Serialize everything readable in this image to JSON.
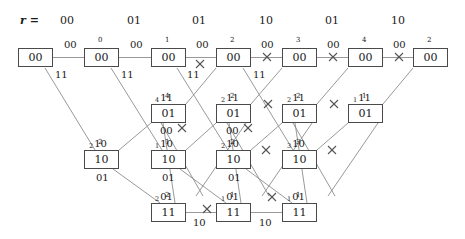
{
  "header": {
    "prefix": "r =",
    "values": [
      "00",
      "01",
      "01",
      "10",
      "01",
      "10"
    ]
  },
  "colors": {
    "box_border": "#4a4a4a",
    "edge": "#8a8a8a",
    "text": "#1a1a1a",
    "background": "#ffffff"
  },
  "chart_data": {
    "type": "diagram",
    "states": [
      "00",
      "01",
      "10",
      "11"
    ],
    "stages": 7,
    "nodes": [
      {
        "id": "s0_0",
        "state": "00",
        "col": 0,
        "x": 18,
        "y": 48,
        "label": "00",
        "metric": ""
      },
      {
        "id": "s1_0",
        "state": "00",
        "col": 1,
        "x": 84,
        "y": 48,
        "label": "00",
        "metric": "0"
      },
      {
        "id": "s2_0",
        "state": "00",
        "col": 2,
        "x": 151,
        "y": 48,
        "label": "00",
        "metric": "1"
      },
      {
        "id": "s3_0",
        "state": "00",
        "col": 3,
        "x": 216,
        "y": 48,
        "label": "00",
        "metric": "2"
      },
      {
        "id": "s4_0",
        "state": "00",
        "col": 4,
        "x": 282,
        "y": 48,
        "label": "00",
        "metric": "3"
      },
      {
        "id": "s5_0",
        "state": "00",
        "col": 5,
        "x": 348,
        "y": 48,
        "label": "00",
        "metric": "4"
      },
      {
        "id": "s6_0",
        "state": "00",
        "col": 6,
        "x": 413,
        "y": 48,
        "label": "00",
        "metric": "2"
      },
      {
        "id": "s2_1",
        "state": "01",
        "col": 2,
        "x": 151,
        "y": 104,
        "label": "01",
        "metric": "4"
      },
      {
        "id": "s3_1",
        "state": "01",
        "col": 3,
        "x": 216,
        "y": 104,
        "label": "01",
        "metric": "2"
      },
      {
        "id": "s4_1",
        "state": "01",
        "col": 4,
        "x": 282,
        "y": 104,
        "label": "01",
        "metric": "2"
      },
      {
        "id": "s5_1",
        "state": "01",
        "col": 5,
        "x": 348,
        "y": 104,
        "label": "01",
        "metric": "1"
      },
      {
        "id": "s1_2",
        "state": "10",
        "col": 1,
        "x": 84,
        "y": 150,
        "label": "10",
        "metric": "2"
      },
      {
        "id": "s2_2",
        "state": "10",
        "col": 2,
        "x": 151,
        "y": 150,
        "label": "10",
        "metric": "1"
      },
      {
        "id": "s3_2",
        "state": "10",
        "col": 3,
        "x": 216,
        "y": 150,
        "label": "10",
        "metric": "2"
      },
      {
        "id": "s4_2",
        "state": "10",
        "col": 4,
        "x": 282,
        "y": 150,
        "label": "10",
        "metric": "3"
      },
      {
        "id": "s2_3",
        "state": "11",
        "col": 2,
        "x": 151,
        "y": 203,
        "label": "11",
        "metric": "2"
      },
      {
        "id": "s3_3",
        "state": "11",
        "col": 3,
        "x": 216,
        "y": 203,
        "label": "11",
        "metric": "1"
      },
      {
        "id": "s4_3",
        "state": "11",
        "col": 4,
        "x": 282,
        "y": 203,
        "label": "11",
        "metric": "1"
      }
    ],
    "edge_labels": [
      {
        "text": "00",
        "x": 64,
        "y": 40,
        "sub": ""
      },
      {
        "text": "00",
        "x": 130,
        "y": 40,
        "sub": ""
      },
      {
        "text": "00",
        "x": 196,
        "y": 40,
        "sub": ""
      },
      {
        "text": "00",
        "x": 261,
        "y": 40,
        "sub": ""
      },
      {
        "text": "00",
        "x": 327,
        "y": 40,
        "sub": ""
      },
      {
        "text": "00",
        "x": 393,
        "y": 40,
        "sub": ""
      },
      {
        "text": "11",
        "x": 55,
        "y": 70,
        "sub": ""
      },
      {
        "text": "11",
        "x": 121,
        "y": 70,
        "sub": ""
      },
      {
        "text": "11",
        "x": 187,
        "y": 70,
        "sub": ""
      },
      {
        "text": "11",
        "x": 253,
        "y": 70,
        "sub": ""
      },
      {
        "text": "11",
        "x": 155,
        "y": 93,
        "sub": "4"
      },
      {
        "text": "11",
        "x": 221,
        "y": 93,
        "sub": "2"
      },
      {
        "text": "11",
        "x": 287,
        "y": 93,
        "sub": "2"
      },
      {
        "text": "11",
        "x": 353,
        "y": 93,
        "sub": "1"
      },
      {
        "text": "00",
        "x": 160,
        "y": 126,
        "sub": ""
      },
      {
        "text": "00",
        "x": 226,
        "y": 126,
        "sub": ""
      },
      {
        "text": "10",
        "x": 89,
        "y": 139,
        "sub": "2"
      },
      {
        "text": "10",
        "x": 155,
        "y": 139,
        "sub": "1"
      },
      {
        "text": "10",
        "x": 221,
        "y": 139,
        "sub": "2"
      },
      {
        "text": "10",
        "x": 287,
        "y": 139,
        "sub": "3"
      },
      {
        "text": "01",
        "x": 96,
        "y": 173,
        "sub": ""
      },
      {
        "text": "01",
        "x": 162,
        "y": 173,
        "sub": ""
      },
      {
        "text": "01",
        "x": 228,
        "y": 173,
        "sub": ""
      },
      {
        "text": "01",
        "x": 155,
        "y": 192,
        "sub": "2"
      },
      {
        "text": "01",
        "x": 221,
        "y": 192,
        "sub": "1"
      },
      {
        "text": "01",
        "x": 287,
        "y": 192,
        "sub": "1"
      },
      {
        "text": "10",
        "x": 193,
        "y": 218,
        "sub": ""
      },
      {
        "text": "10",
        "x": 259,
        "y": 218,
        "sub": ""
      }
    ]
  }
}
